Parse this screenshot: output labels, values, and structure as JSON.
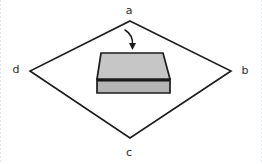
{
  "figure": {
    "background_color": "#ffffff",
    "line_color": "#1c1c1c",
    "label_color": "#2b2b2b",
    "width": 262,
    "height": 164
  },
  "quadrilateral": {
    "name": "abcd",
    "stroke_color": "#1c1c1c",
    "stroke_width": 1.6,
    "vertices": [
      {
        "id": "a",
        "label": "a",
        "position": "top",
        "x": 130,
        "y": 21,
        "label_x": 129,
        "label_y": 10
      },
      {
        "id": "b",
        "label": "b",
        "position": "right",
        "x": 231,
        "y": 71,
        "label_x": 245,
        "label_y": 71
      },
      {
        "id": "c",
        "label": "c",
        "position": "bottom",
        "x": 130,
        "y": 138,
        "label_x": 129,
        "label_y": 152
      },
      {
        "id": "d",
        "label": "d",
        "position": "left",
        "x": 30,
        "y": 71,
        "label_x": 16,
        "label_y": 70
      }
    ],
    "path": "M 130 21 L 231 71 L 130 138 L 30 71 Z"
  },
  "slab": {
    "name": "rectangular-slab",
    "description": "shaded 3d rectangular prism centered inside the quadrilateral",
    "top_face_color": "#c6c6c6",
    "front_face_color": "#b4b4b4",
    "side_face_color": "#a8a8a8",
    "outline_color": "#1c1c1c",
    "top_face_path": "M 101 53 L 163 53 L 170 79 L 97 79 Z",
    "front_face_path": "M 97 79 L 170 79 L 170 93 L 97 93 Z",
    "seam_path": "M 97 80.5 L 170 80.5",
    "bounds": {
      "x": 97,
      "y": 53,
      "width": 73,
      "height": 40
    }
  },
  "arrow": {
    "name": "downward-curved-arrow",
    "description": "small curved arrow from vertex a pointing down toward the slab",
    "color": "#1c1c1c",
    "curve_path": "M 125 30 C 130 33, 133 38, 132.5 45",
    "head_path": "M 132.5 50 L 129 43 L 136 43 Z"
  },
  "labels": {
    "a": "a",
    "b": "b",
    "c": "c",
    "d": "d"
  }
}
